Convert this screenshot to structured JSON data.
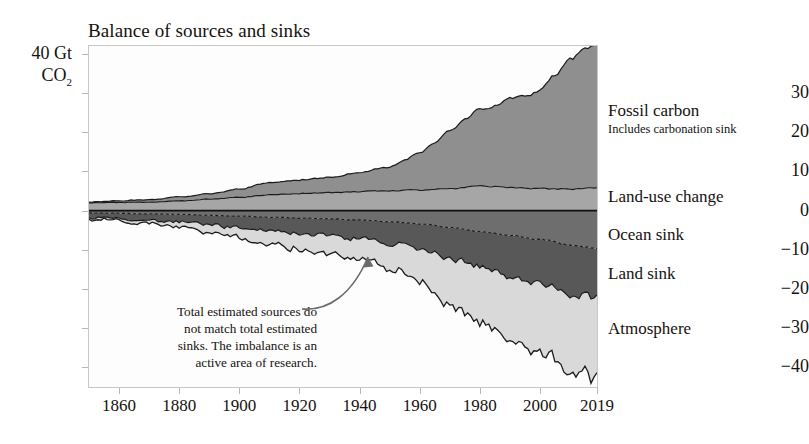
{
  "chart_data": {
    "type": "area",
    "title": "Balance of sources and sinks",
    "xlabel": "",
    "ylabel": "40 Gt CO2",
    "yunit_line1": "40 Gt",
    "yunit_line2": "CO",
    "yunit_sub": "2",
    "xlim": [
      1850,
      2019
    ],
    "ylim": [
      -45,
      42
    ],
    "grid": false,
    "legend_position": "right-inline",
    "ytick_labels": [
      "30",
      "20",
      "10",
      "0",
      "−10",
      "−20",
      "−30",
      "−40"
    ],
    "ytick_values": [
      30,
      20,
      10,
      0,
      -10,
      -20,
      -30,
      -40
    ],
    "xtick_labels": [
      "1860",
      "1880",
      "1900",
      "1920",
      "1940",
      "1960",
      "1980",
      "2000",
      "2019"
    ],
    "xtick_values": [
      1860,
      1880,
      1900,
      1920,
      1940,
      1960,
      1980,
      2000,
      2019
    ],
    "annotation": {
      "text": "Total estimated sources do not match total estimated sinks. The imbalance is an active area of research.",
      "lines": [
        "Total estimated sources do",
        "not match total estimated",
        "sinks. The imbalance is an",
        "active area of research."
      ],
      "points_to": "imbalance-band"
    },
    "colors": {
      "fossil": "#8f8f8f",
      "landuse": "#a6a6a6",
      "ocean": "#6e6e6e",
      "land_sink": "#585858",
      "atmosphere": "#d9d9d9",
      "stroke": "#1b1b1b",
      "frame": "#c9c7c4",
      "background": "#fdfdfd"
    },
    "series": [
      {
        "name": "Fossil carbon",
        "sublabel": "Includes carbonation sink",
        "sign": "positive",
        "color": "#8f8f8f",
        "label_x": 608,
        "label_y": 112,
        "sub_y": 131,
        "x": [
          1850,
          1860,
          1870,
          1880,
          1890,
          1900,
          1910,
          1920,
          1930,
          1940,
          1950,
          1955,
          1960,
          1965,
          1970,
          1975,
          1980,
          1985,
          1990,
          1995,
          2000,
          2005,
          2010,
          2015,
          2019
        ],
        "values": [
          0.2,
          0.4,
          0.6,
          1.0,
          1.4,
          2.1,
          3.1,
          3.5,
          3.9,
          4.8,
          6.0,
          7.6,
          9.6,
          11.9,
          15.0,
          17.4,
          19.5,
          20.5,
          22.7,
          23.6,
          25.0,
          29.0,
          33.2,
          35.5,
          36.7
        ]
      },
      {
        "name": "Land-use change",
        "sign": "positive",
        "color": "#a6a6a6",
        "label_x": 608,
        "label_y": 198,
        "x": [
          1850,
          1860,
          1870,
          1880,
          1890,
          1900,
          1910,
          1920,
          1930,
          1940,
          1950,
          1960,
          1970,
          1980,
          1990,
          2000,
          2010,
          2019
        ],
        "values": [
          2.0,
          2.1,
          2.2,
          2.5,
          2.9,
          3.4,
          4.0,
          4.4,
          4.6,
          4.9,
          5.1,
          5.3,
          5.6,
          6.3,
          5.9,
          5.6,
          5.5,
          5.8
        ]
      },
      {
        "name": "Ocean sink",
        "sign": "negative",
        "color": "#6e6e6e",
        "label_x": 608,
        "label_y": 236,
        "x": [
          1850,
          1860,
          1870,
          1880,
          1890,
          1900,
          1910,
          1920,
          1930,
          1940,
          1950,
          1960,
          1970,
          1980,
          1990,
          2000,
          2010,
          2019
        ],
        "values": [
          -0.6,
          -0.7,
          -0.8,
          -1.0,
          -1.2,
          -1.4,
          -1.7,
          -1.9,
          -2.1,
          -2.4,
          -2.8,
          -3.4,
          -4.3,
          -5.3,
          -6.3,
          -7.3,
          -8.8,
          -9.6
        ]
      },
      {
        "name": "Land sink",
        "sign": "negative",
        "color": "#585858",
        "label_x": 608,
        "label_y": 275,
        "x": [
          1850,
          1860,
          1870,
          1880,
          1890,
          1900,
          1910,
          1920,
          1930,
          1940,
          1950,
          1960,
          1970,
          1980,
          1990,
          2000,
          2010,
          2019
        ],
        "values": [
          -1.2,
          -1.4,
          -1.6,
          -2.0,
          -2.4,
          -2.9,
          -3.4,
          -3.9,
          -4.2,
          -4.9,
          -5.6,
          -6.5,
          -7.9,
          -9.0,
          -10.2,
          -11.1,
          -12.4,
          -12.9
        ]
      },
      {
        "name": "Atmosphere",
        "sign": "negative",
        "color": "#d9d9d9",
        "label_x": 608,
        "label_y": 330,
        "x": [
          1850,
          1860,
          1870,
          1880,
          1890,
          1900,
          1910,
          1920,
          1930,
          1940,
          1950,
          1960,
          1970,
          1980,
          1990,
          2000,
          2010,
          2019
        ],
        "values": [
          -0.4,
          -0.6,
          -0.8,
          -1.3,
          -1.8,
          -2.6,
          -3.6,
          -4.0,
          -4.6,
          -5.2,
          -6.4,
          -8.4,
          -11.6,
          -13.9,
          -16.3,
          -17.2,
          -19.5,
          -20.6
        ]
      }
    ]
  },
  "ui": {
    "plot_left": 88,
    "plot_top": 45,
    "plot_width": 510,
    "plot_height": 343
  }
}
